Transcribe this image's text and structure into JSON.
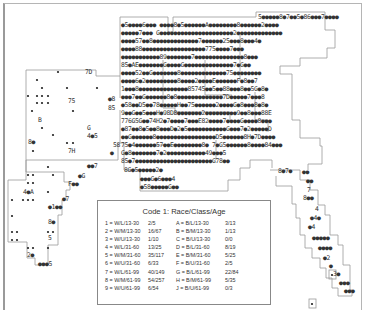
{
  "legend": {
    "title": "Code 1: Race/Class/Age",
    "rows": [
      {
        "wcode": "1 = W/L/13-30",
        "wratio": "2/5",
        "bcode": "A = B/L/13-30",
        "bratio": "3/13"
      },
      {
        "wcode": "2 = W/M/13-30",
        "wratio": "16/67",
        "bcode": "B = B/M/13-30",
        "bratio": "1/13"
      },
      {
        "wcode": "3 = W/U/13-30",
        "wratio": "1/10",
        "bcode": "C = B/U/13-30",
        "bratio": "0/0"
      },
      {
        "wcode": "4 = W/L/31-60",
        "wratio": "13/25",
        "bcode": "D = B/L/31-60",
        "bratio": "8/19"
      },
      {
        "wcode": "5 = W/M/31-60",
        "wratio": "35/117",
        "bcode": "E = B/M/31-60",
        "bratio": "5/25"
      },
      {
        "wcode": "6 = W/U/31-60",
        "wratio": "6/33",
        "bcode": "F = B/U/31-60",
        "bratio": "2/5"
      },
      {
        "wcode": "7 = W/L/61-99",
        "wratio": "40/149",
        "bcode": "G = B/L/61-99",
        "bratio": "22/84"
      },
      {
        "wcode": "8 = W/M/61-99",
        "wratio": "54/257",
        "bcode": "H = B/M/61-99",
        "bratio": "5/35"
      },
      {
        "wcode": "9 = W/U/61-99",
        "wratio": "6/54",
        "bcode": "J = B/U/61-99",
        "bratio": "0/3"
      }
    ]
  },
  "map": {
    "dense_rows": [
      {
        "x": 258,
        "y": 19,
        "text": "5●●●●●8●7●●5●86●●●7●●●●"
      },
      {
        "x": 121,
        "y": 27,
        "text": "●5●●●●6●●●  ●●●●8●5●●●●●●A●●●●●●●●8●●●●●●2●●●●"
      },
      {
        "x": 121,
        "y": 35,
        "text": "●●●●●7●●●  G●●●●●●●●●●●●●●●●●●●●●2●●●●●●●●●●●●●"
      },
      {
        "x": 121,
        "y": 43,
        "text": "●●●●57●●8●●●●●●●●●●●●●7●●●●●●25●●●8●●●4●"
      },
      {
        "x": 121,
        "y": 51,
        "text": "●●●●88●●●●●●●●●●●●●●●●●●775●●●●7●●●"
      },
      {
        "x": 121,
        "y": 59,
        "text": "●●●●●●●●●●●89●●●●●●●7●●●●●●●●●●●●●●8●●●"
      },
      {
        "x": 121,
        "y": 67,
        "text": "85●AE●●●●●●●G●●●●G●●●●●●●●●●●●●●7●G●●"
      },
      {
        "x": 121,
        "y": 75,
        "text": "●●●●52●●G●●●●●●●8●●●●●●●●●●●●●75●●●●●●●●"
      },
      {
        "x": 121,
        "y": 83,
        "text": "●●●●6●2●●●●●●●●●8●●●●2●●●●E●●●●●●F●8●●7"
      },
      {
        "x": 121,
        "y": 91,
        "text": "1●●●8●●●●●●●●●●●●●●85745●●5●●88●●●8●●5G●8●"
      },
      {
        "x": 121,
        "y": 99,
        "text": "●●●7●●G●●●●●●8●8●●●●●●●●●●●●●7D●●●●●7●●●8"
      },
      {
        "x": 121,
        "y": 107,
        "text": "●58●●D5●●78●●●●●H●●75●●●●●●2●●●●G●8●●●8●8●"
      },
      {
        "x": 121,
        "y": 115,
        "text": "9●●G●●5●●●H●98D8●●●●●●●2●●●●●●●●●9●●8●●●88E"
      },
      {
        "x": 121,
        "y": 123,
        "text": "776G5G●●74H2●7●●●●7●●●E82●●●●7●●●●G●●●●8●●●"
      },
      {
        "x": 121,
        "y": 131,
        "text": "●87●●8●5●●8●●●D●2●5●●●●●●●●●●●G●●●7●2●●●●●D"
      },
      {
        "x": 121,
        "y": 139,
        "text": "●●G●●●●●●8●●●●●●●●●●●●●●●●●D5●●●●●●8H●7D●●●●"
      },
      {
        "x": 121,
        "y": 147,
        "text": "75●4●●●●●●57●●E●●●●●●●●8●  7●G5●●●●●●8●●●●84●●●"
      },
      {
        "x": 121,
        "y": 155,
        "text": "G●8●●●●●●●7●2●●●●●●●●●●●49●●●5"
      },
      {
        "x": 121,
        "y": 163,
        "text": "85●7●●●●●●●●●●●●●●●●●●●●●●G78●●"
      },
      {
        "x": 124,
        "y": 172,
        "text": "8G●5●●●●●2●"
      },
      {
        "x": 140,
        "y": 181,
        "text": "●●●G●6●●●4"
      },
      {
        "x": 140,
        "y": 189,
        "text": "●58●●●●●G●●"
      }
    ],
    "left_labels": [
      {
        "x": 85,
        "y": 74,
        "text": "7D"
      },
      {
        "x": 68,
        "y": 103,
        "text": "75"
      },
      {
        "x": 38,
        "y": 122,
        "text": "B"
      },
      {
        "x": 87,
        "y": 130,
        "text": "G"
      },
      {
        "x": 87,
        "y": 138,
        "text": "4●5"
      },
      {
        "x": 28,
        "y": 144,
        "text": "8●"
      },
      {
        "x": 68,
        "y": 153,
        "text": "7H"
      },
      {
        "x": 108,
        "y": 101,
        "text": "●8"
      },
      {
        "x": 108,
        "y": 110,
        "text": "85"
      },
      {
        "x": 113,
        "y": 147,
        "text": "58"
      },
      {
        "x": 110,
        "y": 155,
        "text": "●"
      },
      {
        "x": 87,
        "y": 168,
        "text": "●●7"
      },
      {
        "x": 23,
        "y": 194,
        "text": "4●A"
      },
      {
        "x": 62,
        "y": 201,
        "text": "●7"
      },
      {
        "x": 48,
        "y": 209,
        "text": "●1●●"
      },
      {
        "x": 48,
        "y": 224,
        "text": "8●"
      },
      {
        "x": 48,
        "y": 240,
        "text": "5"
      },
      {
        "x": 27,
        "y": 257,
        "text": "2●"
      },
      {
        "x": 38,
        "y": 266,
        "text": "●●●5"
      },
      {
        "x": 78,
        "y": 178,
        "text": "●G"
      },
      {
        "x": 68,
        "y": 186,
        "text": "F●●"
      },
      {
        "x": 62,
        "y": 204,
        "text": ""
      }
    ],
    "right_labels": [
      {
        "x": 278,
        "y": 173,
        "text": "8●7●"
      },
      {
        "x": 302,
        "y": 174,
        "text": "●●"
      },
      {
        "x": 306,
        "y": 183,
        "text": "●●"
      },
      {
        "x": 307,
        "y": 192,
        "text": "7"
      },
      {
        "x": 303,
        "y": 200,
        "text": "8●●"
      },
      {
        "x": 315,
        "y": 211,
        "text": "4"
      },
      {
        "x": 310,
        "y": 220,
        "text": "●4●"
      },
      {
        "x": 308,
        "y": 229,
        "text": "●4"
      },
      {
        "x": 312,
        "y": 240,
        "text": "●●●●●"
      },
      {
        "x": 318,
        "y": 250,
        "text": "●●●●"
      },
      {
        "x": 323,
        "y": 260,
        "text": "●2"
      },
      {
        "x": 329,
        "y": 268,
        "text": "●"
      },
      {
        "x": 333,
        "y": 276,
        "text": "3●"
      },
      {
        "x": 339,
        "y": 285,
        "text": "●●●"
      },
      {
        "x": 344,
        "y": 293,
        "text": "●●●"
      }
    ]
  }
}
